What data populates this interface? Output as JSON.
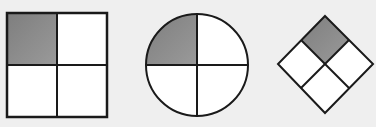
{
  "colors": {
    "background": "#efefef",
    "shaded": "#8a8a8a",
    "unshaded": "#ffffff",
    "stroke": "#1a1a1a"
  },
  "shapes": [
    {
      "type": "square",
      "parts": 4,
      "shaded_parts": 1,
      "shaded_position": "top-left"
    },
    {
      "type": "circle",
      "parts": 4,
      "shaded_parts": 1,
      "shaded_position": "top-left"
    },
    {
      "type": "diamond",
      "parts": 4,
      "shaded_parts": 1,
      "shaded_position": "top"
    }
  ]
}
